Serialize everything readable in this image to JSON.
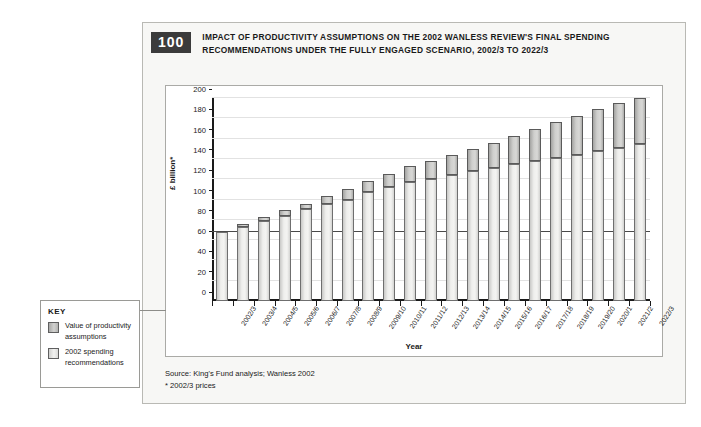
{
  "figure": {
    "number": "100",
    "title": "IMPACT OF PRODUCTIVITY ASSUMPTIONS ON THE 2002 WANLESS REVIEW'S FINAL SPENDING RECOMMENDATIONS UNDER THE FULLY ENGAGED SCENARIO, 2002/3 TO 2022/3",
    "source_line": "Source: King's Fund analysis; Wanless 2002",
    "note_line": "* 2002/3 prices"
  },
  "key": {
    "heading": "KEY",
    "items": [
      {
        "label": "Value of productivity assumptions",
        "color": "#c6c6c4",
        "series": "productivity"
      },
      {
        "label": "2002 spending recommendations",
        "color": "#eeeeec",
        "series": "recommendations"
      }
    ]
  },
  "chart_data": {
    "type": "bar",
    "stacked": true,
    "title": "Impact of productivity assumptions on the 2002 Wanless Review's final spending recommendations under the fully engaged scenario, 2002/3 to 2022/3",
    "xlabel": "Year",
    "ylabel": "£ billion*",
    "ylim": [
      0,
      200
    ],
    "ytick_step": 20,
    "yticks": [
      0,
      20,
      40,
      60,
      80,
      100,
      120,
      140,
      160,
      180,
      200
    ],
    "grid": true,
    "legend_position": "left-outside",
    "reference_line": {
      "value": 68,
      "label": "2002/3 baseline"
    },
    "categories": [
      "2002/3",
      "2003/4",
      "2004/5",
      "2005/6",
      "2006/7",
      "2007/8",
      "2008/9",
      "2009/10",
      "2010/11",
      "2011/12",
      "2012/13",
      "2013/14",
      "2014/15",
      "2015/16",
      "2016/17",
      "2017/18",
      "2018/19",
      "2019/20",
      "2020/1",
      "2021/2",
      "2022/3"
    ],
    "series": [
      {
        "name": "2002 spending recommendations",
        "values": [
          68,
          73,
          79,
          84,
          91,
          96,
          100,
          107,
          112,
          117,
          120,
          124,
          128,
          131,
          135,
          138,
          141,
          144,
          148,
          151,
          155
        ]
      },
      {
        "name": "Value of productivity assumptions",
        "values": [
          0,
          3,
          4,
          6,
          5,
          7,
          10,
          11,
          13,
          16,
          18,
          20,
          22,
          25,
          28,
          31,
          35,
          38,
          41,
          44,
          45
        ]
      }
    ],
    "totals": [
      68,
      76,
      83,
      90,
      96,
      103,
      110,
      118,
      125,
      133,
      138,
      144,
      150,
      156,
      163,
      169,
      176,
      182,
      189,
      195,
      200
    ]
  }
}
